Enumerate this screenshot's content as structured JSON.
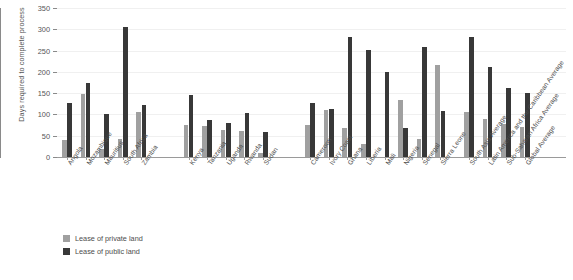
{
  "chart_data": {
    "type": "bar",
    "title": "",
    "xlabel": "",
    "ylabel": "Days required to complete process",
    "ylim": [
      0,
      350
    ],
    "yticks": [
      0,
      50,
      100,
      150,
      200,
      250,
      300,
      350
    ],
    "grid": true,
    "legend_position": "bottom-left",
    "categories": [
      "Angola",
      "Mozambique",
      "Mauritius",
      "South Africa",
      "Zambia",
      "Ethiopia",
      "Kenya",
      "Tanzania",
      "Uganda",
      "Rwanda",
      "Sudan",
      "Burkina Faso",
      "Cameroon",
      "Ivory Coast",
      "Ghana",
      "Liberia",
      "Mali",
      "Nigeria",
      "Senegal",
      "Sierra Leone",
      "South Asia Average",
      "Latin America and the Caribbean Average",
      "Sub-Saharan Africa Average",
      "Global Average"
    ],
    "group_breaks": [
      5,
      11,
      20
    ],
    "series": [
      {
        "name": "Lease of private land",
        "color": "#a0a0a0",
        "values": [
          40,
          147,
          20,
          43,
          105,
          0,
          76,
          73,
          64,
          62,
          10,
          0,
          76,
          111,
          67,
          31,
          0,
          133,
          42,
          216,
          105,
          89,
          78,
          70
        ]
      },
      {
        "name": "Lease of public land",
        "color": "#383838",
        "values": [
          128,
          175,
          100,
          305,
          123,
          0,
          146,
          87,
          80,
          103,
          58,
          0,
          127,
          113,
          281,
          251,
          199,
          67,
          259,
          109,
          283,
          211,
          163,
          150
        ]
      }
    ]
  },
  "legend": {
    "items": [
      {
        "label": "Lease of private land",
        "color": "#a0a0a0"
      },
      {
        "label": "Lease of public land",
        "color": "#383838"
      }
    ]
  },
  "axis": {
    "y_title": "Days required to complete process"
  }
}
